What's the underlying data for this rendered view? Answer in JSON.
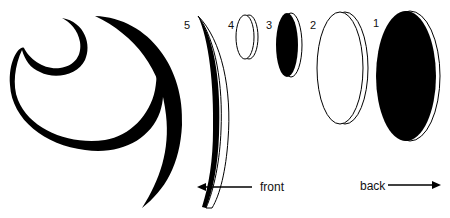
{
  "diagram": {
    "layers": [
      {
        "id": 1,
        "label": "1",
        "fill": "#000000"
      },
      {
        "id": 2,
        "label": "2",
        "fill": "#ffffff"
      },
      {
        "id": 3,
        "label": "3",
        "fill": "#000000"
      },
      {
        "id": 4,
        "label": "4",
        "fill": "#ffffff"
      },
      {
        "id": 5,
        "label": "5",
        "fill": "#000000"
      }
    ],
    "arrows": {
      "front_label": "front",
      "back_label": "back"
    },
    "colors": {
      "ink": "#000000",
      "background": "#ffffff"
    }
  }
}
